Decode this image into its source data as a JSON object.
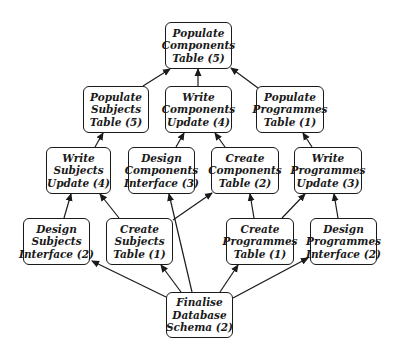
{
  "diagram": {
    "type": "dependency-graph",
    "nodes": [
      {
        "id": "pop_comp",
        "lines": [
          "Populate",
          "Components",
          "Table (5)"
        ],
        "x": 165,
        "y": 22,
        "w": 67,
        "h": 47
      },
      {
        "id": "pop_subj",
        "lines": [
          "Populate",
          "Subjects",
          "Table (5)"
        ],
        "x": 83,
        "y": 86,
        "w": 66,
        "h": 47
      },
      {
        "id": "write_comp",
        "lines": [
          "Write",
          "Components",
          "Update (4)"
        ],
        "x": 165,
        "y": 86,
        "w": 67,
        "h": 47
      },
      {
        "id": "pop_prog",
        "lines": [
          "Populate",
          "Programmes",
          "Table (1)"
        ],
        "x": 256,
        "y": 86,
        "w": 68,
        "h": 47
      },
      {
        "id": "write_subj",
        "lines": [
          "Write",
          "Subjects",
          "Update (4)"
        ],
        "x": 46,
        "y": 147,
        "w": 65,
        "h": 47
      },
      {
        "id": "design_comp",
        "lines": [
          "Design",
          "Components",
          "Interface (3)"
        ],
        "x": 128,
        "y": 147,
        "w": 67,
        "h": 47
      },
      {
        "id": "create_comp",
        "lines": [
          "Create",
          "Components",
          "Table (2)"
        ],
        "x": 211,
        "y": 147,
        "w": 68,
        "h": 47
      },
      {
        "id": "write_prog",
        "lines": [
          "Write",
          "Programmes",
          "Update (3)"
        ],
        "x": 294,
        "y": 147,
        "w": 68,
        "h": 47
      },
      {
        "id": "design_subj",
        "lines": [
          "Design",
          "Subjects",
          "Interface (2)"
        ],
        "x": 23,
        "y": 218,
        "w": 67,
        "h": 47
      },
      {
        "id": "create_subj",
        "lines": [
          "Create",
          "Subjects",
          "Table (1)"
        ],
        "x": 106,
        "y": 218,
        "w": 67,
        "h": 47
      },
      {
        "id": "create_prog",
        "lines": [
          "Create",
          "Programmes",
          "Table (1)"
        ],
        "x": 226,
        "y": 218,
        "w": 68,
        "h": 47
      },
      {
        "id": "design_prog",
        "lines": [
          "Design",
          "Programmes",
          "Interface (2)"
        ],
        "x": 310,
        "y": 218,
        "w": 67,
        "h": 47
      },
      {
        "id": "finalise",
        "lines": [
          "Finalise",
          "Database",
          "Schema (2)"
        ],
        "x": 166,
        "y": 292,
        "w": 67,
        "h": 46
      }
    ],
    "edges": [
      {
        "from": "pop_subj",
        "to": "pop_comp",
        "x1": 143,
        "y1": 86,
        "x2": 170,
        "y2": 69
      },
      {
        "from": "write_comp",
        "to": "pop_comp",
        "x1": 198,
        "y1": 86,
        "x2": 198,
        "y2": 69
      },
      {
        "from": "pop_prog",
        "to": "pop_comp",
        "x1": 258,
        "y1": 88,
        "x2": 231,
        "y2": 68
      },
      {
        "from": "write_subj",
        "to": "pop_subj",
        "x1": 95,
        "y1": 147,
        "x2": 103,
        "y2": 133
      },
      {
        "from": "design_comp",
        "to": "write_comp",
        "x1": 176,
        "y1": 147,
        "x2": 184,
        "y2": 133
      },
      {
        "from": "create_comp",
        "to": "write_comp",
        "x1": 225,
        "y1": 147,
        "x2": 215,
        "y2": 133
      },
      {
        "from": "write_prog",
        "to": "pop_prog",
        "x1": 312,
        "y1": 147,
        "x2": 303,
        "y2": 133
      },
      {
        "from": "design_subj",
        "to": "write_subj",
        "x1": 64,
        "y1": 218,
        "x2": 71,
        "y2": 194
      },
      {
        "from": "create_subj",
        "to": "write_subj",
        "x1": 119,
        "y1": 218,
        "x2": 100,
        "y2": 194
      },
      {
        "from": "finalise",
        "to": "design_comp",
        "x1": 192,
        "y1": 292,
        "x2": 169,
        "y2": 194
      },
      {
        "from": "create_subj",
        "to": "create_comp",
        "x1": 173,
        "y1": 220,
        "x2": 212,
        "y2": 193
      },
      {
        "from": "create_prog",
        "to": "create_comp",
        "x1": 254,
        "y1": 218,
        "x2": 250,
        "y2": 194
      },
      {
        "from": "create_prog",
        "to": "write_prog",
        "x1": 282,
        "y1": 218,
        "x2": 305,
        "y2": 194
      },
      {
        "from": "design_prog",
        "to": "write_prog",
        "x1": 338,
        "y1": 218,
        "x2": 334,
        "y2": 194
      },
      {
        "from": "finalise",
        "to": "design_subj",
        "x1": 166,
        "y1": 297,
        "x2": 92,
        "y2": 261
      },
      {
        "from": "finalise",
        "to": "create_subj",
        "x1": 181,
        "y1": 292,
        "x2": 161,
        "y2": 265
      },
      {
        "from": "finalise",
        "to": "create_prog",
        "x1": 220,
        "y1": 292,
        "x2": 238,
        "y2": 265
      },
      {
        "from": "finalise",
        "to": "design_prog",
        "x1": 233,
        "y1": 298,
        "x2": 308,
        "y2": 258
      }
    ],
    "colors": {
      "stroke": "#1a1a1a",
      "background": "#ffffff",
      "text": "#1a1a1a"
    }
  }
}
